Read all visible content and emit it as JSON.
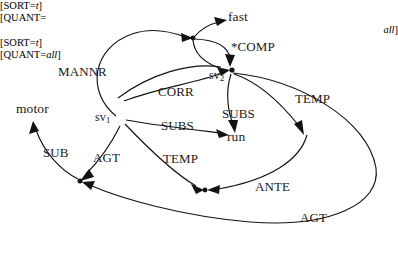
{
  "figure": {
    "type": "semantic-network-diagram",
    "background_color": "#ffffff",
    "ink_color": "#121212",
    "width": 398,
    "height": 256
  },
  "nodes": [
    {
      "id": "fast",
      "label": "fast",
      "x": 228,
      "y": 18
    },
    {
      "id": "motor",
      "label": "motor",
      "x": 16,
      "y": 110
    },
    {
      "id": "run",
      "label": "run",
      "x": 235,
      "y": 138
    },
    {
      "id": "sv1",
      "label": "sv",
      "sub": "1",
      "x": 97,
      "y": 112
    },
    {
      "id": "sv2",
      "label": "sv",
      "sub": "2",
      "x": 232,
      "y": 70
    }
  ],
  "feature_blocks": [
    {
      "id": "feat-right",
      "lines": [
        "[SORT=t]",
        "[QUANT=",
        "all]"
      ],
      "italic_parts": [
        "t",
        "all"
      ],
      "x": 309,
      "y": 140
    },
    {
      "id": "feat-bottom",
      "lines": [
        "[SORT=t]",
        "[QUANT=all]"
      ],
      "italic_parts": [
        "t",
        "all"
      ],
      "x": 169,
      "y": 196
    }
  ],
  "edge_labels": [
    {
      "id": "mannr",
      "label": "MANNR",
      "x": 58,
      "y": 65
    },
    {
      "id": "comp",
      "label": "*COMP",
      "x": 231,
      "y": 40
    },
    {
      "id": "corr",
      "label": "CORR",
      "x": 158,
      "y": 89
    },
    {
      "id": "subs-upper",
      "label": "SUBS",
      "x": 223,
      "y": 113
    },
    {
      "id": "subs-lower",
      "label": "SUBS",
      "x": 161,
      "y": 128
    },
    {
      "id": "temp-right",
      "label": "TEMP",
      "x": 295,
      "y": 96
    },
    {
      "id": "temp-mid",
      "label": "TEMP",
      "x": 164,
      "y": 155
    },
    {
      "id": "sub",
      "label": "SUB",
      "x": 44,
      "y": 148
    },
    {
      "id": "agt-left",
      "label": "AGT",
      "x": 94,
      "y": 153
    },
    {
      "id": "ante",
      "label": "ANTE",
      "x": 256,
      "y": 182
    },
    {
      "id": "agt-bottom",
      "label": "AGT",
      "x": 300,
      "y": 213
    }
  ],
  "edges": [
    {
      "id": "sv1-to-junction-mannr",
      "label": "MANNR",
      "from": "sv1",
      "to": "junction-top"
    },
    {
      "id": "junction-to-fast",
      "label": "",
      "from": "junction-top",
      "to": "fast"
    },
    {
      "id": "junction-to-sv2",
      "label": "*COMP",
      "from": "junction-top",
      "to": "sv2"
    },
    {
      "id": "sv1-to-sv2-corr",
      "label": "CORR",
      "from": "sv1",
      "to": "sv2"
    },
    {
      "id": "sv2-to-run-subs",
      "label": "SUBS",
      "from": "sv2",
      "to": "run"
    },
    {
      "id": "sv1-to-run-subs",
      "label": "SUBS",
      "from": "sv1",
      "to": "run"
    },
    {
      "id": "sv2-to-feat-temp",
      "label": "TEMP",
      "from": "sv2",
      "to": "feat-right"
    },
    {
      "id": "sv1-to-featbottom-temp",
      "label": "TEMP",
      "from": "sv1",
      "to": "feat-bottom"
    },
    {
      "id": "sv2-to-featbottom-ante",
      "label": "ANTE",
      "from": "sv2",
      "to": "feat-bottom"
    },
    {
      "id": "sv1-to-junction-agt",
      "label": "AGT",
      "from": "sv1",
      "to": "junction-left"
    },
    {
      "id": "junction-to-motor-sub",
      "label": "SUB",
      "from": "junction-left",
      "to": "motor"
    },
    {
      "id": "sv2-to-junction-agt",
      "label": "AGT",
      "from": "sv2",
      "to": "junction-left"
    }
  ]
}
